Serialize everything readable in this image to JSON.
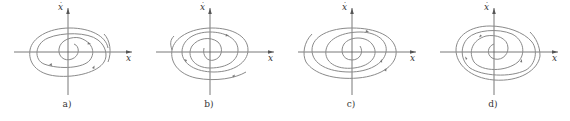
{
  "figure": {
    "panels": [
      {
        "id": "a",
        "caption": "a)",
        "x_axis_label": "x",
        "y_axis_label": "x",
        "y_axis_dot": "˙",
        "spiral_direction": "clockwise-outward"
      },
      {
        "id": "b",
        "caption": "b)",
        "x_axis_label": "x",
        "y_axis_label": "x",
        "y_axis_dot": "˙",
        "spiral_direction": "clockwise-outward"
      },
      {
        "id": "c",
        "caption": "c)",
        "x_axis_label": "x",
        "y_axis_label": "x",
        "y_axis_dot": "˙",
        "spiral_direction": "clockwise-outward"
      },
      {
        "id": "d",
        "caption": "d)",
        "x_axis_label": "x",
        "y_axis_label": "x",
        "y_axis_dot": "˙",
        "spiral_direction": "clockwise-outward"
      }
    ],
    "colors": {
      "curve": "#8a8a8a",
      "axis": "#555555",
      "text": "#333333"
    }
  }
}
